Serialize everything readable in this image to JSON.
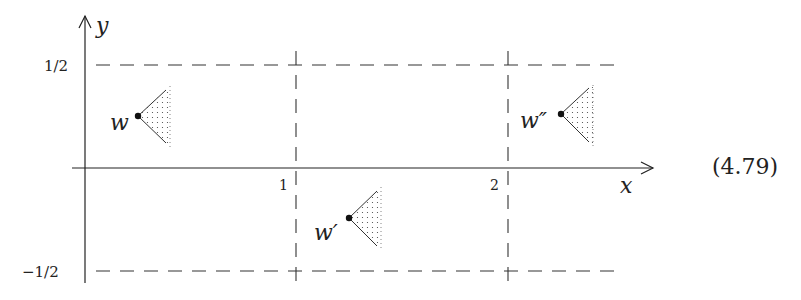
{
  "axes": {
    "x_label": "x",
    "y_label": "y",
    "x_ticks": [
      "1",
      "2"
    ],
    "y_ticks": [
      "1/2",
      "−1/2"
    ]
  },
  "points": [
    {
      "label": "w",
      "x_pos": 138,
      "y_pos": 116
    },
    {
      "label": "w′",
      "x_pos": 349,
      "y_pos": 218
    },
    {
      "label": "w″",
      "x_pos": 561,
      "y_pos": 114
    }
  ],
  "equation_number": "(4.79)",
  "colors": {
    "ink": "#222222",
    "dash": "#333333",
    "background": "#ffffff"
  }
}
